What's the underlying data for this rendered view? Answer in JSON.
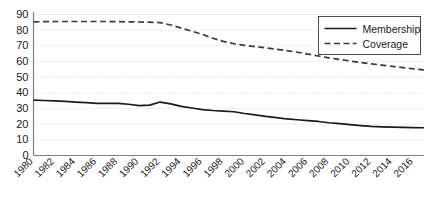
{
  "chart_data": {
    "type": "line",
    "title": "",
    "xlabel": "",
    "ylabel": "",
    "grid": true,
    "legend_position": "top-right",
    "xlim": [
      1980,
      2017
    ],
    "ylim": [
      0,
      90
    ],
    "ytick_labels": [
      "0",
      "10",
      "20",
      "30",
      "40",
      "50",
      "60",
      "70",
      "80",
      "90"
    ],
    "ytick_values": [
      0,
      10,
      20,
      30,
      40,
      50,
      60,
      70,
      80,
      90
    ],
    "xtick_labels": [
      "1980",
      "1982",
      "1984",
      "1986",
      "1988",
      "1990",
      "1992",
      "1994",
      "1996",
      "1998",
      "2000",
      "2002",
      "2004",
      "2006",
      "2008",
      "2010",
      "2012",
      "2014",
      "2016"
    ],
    "xtick_values": [
      1980,
      1982,
      1984,
      1986,
      1988,
      1990,
      1992,
      1994,
      1996,
      1998,
      2000,
      2002,
      2004,
      2006,
      2008,
      2010,
      2012,
      2014,
      2016
    ],
    "x": [
      1980,
      1981,
      1982,
      1983,
      1984,
      1985,
      1986,
      1987,
      1988,
      1989,
      1990,
      1991,
      1992,
      1993,
      1994,
      1995,
      1996,
      1997,
      1998,
      1999,
      2000,
      2001,
      2002,
      2003,
      2004,
      2005,
      2006,
      2007,
      2008,
      2009,
      2010,
      2011,
      2012,
      2013,
      2014,
      2015,
      2016,
      2017
    ],
    "series": [
      {
        "name": "Membership",
        "style": "solid",
        "color": "#1a1a1a",
        "values": [
          35.0,
          34.8,
          34.5,
          34.2,
          33.8,
          33.4,
          33.0,
          33.0,
          32.9,
          32.4,
          31.5,
          31.8,
          33.8,
          32.6,
          31.0,
          30.0,
          29.0,
          28.4,
          28.0,
          27.6,
          26.5,
          25.6,
          24.6,
          23.8,
          23.0,
          22.5,
          22.0,
          21.4,
          20.6,
          20.0,
          19.4,
          18.8,
          18.3,
          18.0,
          17.8,
          17.6,
          17.5,
          17.4
        ]
      },
      {
        "name": "Coverage",
        "style": "dashed",
        "color": "#3a3a3a",
        "values": [
          85.0,
          85.1,
          85.2,
          85.2,
          85.2,
          85.2,
          85.2,
          85.2,
          85.1,
          85.0,
          84.9,
          84.8,
          84.5,
          83.0,
          81.0,
          79.0,
          77.0,
          74.5,
          72.5,
          71.0,
          70.0,
          69.2,
          68.4,
          67.5,
          66.6,
          65.6,
          64.4,
          63.2,
          62.0,
          61.0,
          60.0,
          59.0,
          58.2,
          57.4,
          56.6,
          55.8,
          55.0,
          54.3
        ]
      }
    ]
  },
  "legend": {
    "entries": [
      {
        "label": "Membership",
        "style": "solid"
      },
      {
        "label": "Coverage",
        "style": "dashed"
      }
    ]
  }
}
